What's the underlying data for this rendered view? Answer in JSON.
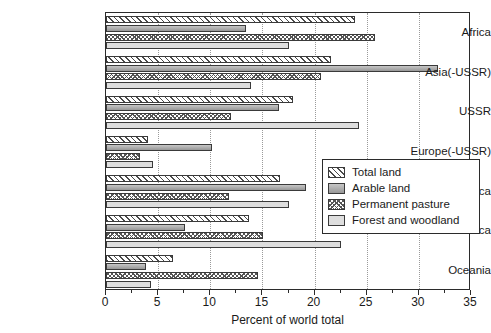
{
  "chart_data": {
    "type": "bar",
    "orientation": "horizontal",
    "title": "",
    "xlabel": "Percent of world total",
    "ylabel": "",
    "xlim": [
      0,
      35
    ],
    "xticks": [
      0,
      5,
      10,
      15,
      20,
      25,
      30,
      35
    ],
    "xtick_labels": [
      "0",
      "5",
      "10",
      "15",
      "20",
      "25",
      "30",
      "35"
    ],
    "grid": "vertical-dotted",
    "legend_position": "center-right-inside",
    "categories": [
      "Africa",
      "Asia(-USSR)",
      "USSR",
      "Europe(-USSR)",
      "N and C America",
      "S. America",
      "Oceania"
    ],
    "series": [
      {
        "name": "Total land",
        "pattern": "diagonal-hatch",
        "values": [
          23.9,
          21.6,
          17.9,
          4.0,
          16.7,
          13.7,
          6.4
        ]
      },
      {
        "name": "Arable land",
        "pattern": "solid-gray",
        "values": [
          13.4,
          31.8,
          16.6,
          10.2,
          19.2,
          7.6,
          3.8
        ]
      },
      {
        "name": "Permanent pasture",
        "pattern": "cross-hatch-dots",
        "values": [
          25.8,
          20.6,
          12.0,
          3.3,
          11.8,
          15.1,
          14.6
        ]
      },
      {
        "name": "Forest and woodland",
        "pattern": "light-gray",
        "values": [
          17.5,
          13.9,
          24.3,
          4.5,
          17.5,
          22.5,
          4.3
        ]
      }
    ]
  },
  "legend": {
    "items": [
      {
        "label": "Total land"
      },
      {
        "label": "Arable land"
      },
      {
        "label": "Permanent pasture"
      },
      {
        "label": "Forest and woodland"
      }
    ]
  }
}
